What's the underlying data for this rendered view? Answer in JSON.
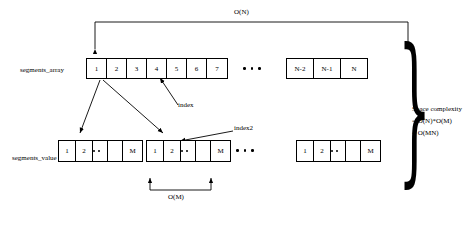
{
  "diagram": {
    "title_complexity_top": "O(N)",
    "labels": {
      "segments_array": "segments_array",
      "segments_value": "segments_value",
      "index": "index",
      "index2": "index2",
      "o_m": "O(M)",
      "space_complexity": "Space complexity",
      "space_eq1": "= O(N)*O(M)",
      "space_eq2": "= O(MN)"
    },
    "top_array": {
      "cells_left": [
        "1",
        "2",
        "3",
        "4",
        "5",
        "6",
        "7"
      ],
      "cells_right": [
        "N-2",
        "N-1",
        "N"
      ]
    },
    "value_arrays": [
      {
        "cells": [
          "1",
          "2",
          "",
          "",
          "M"
        ]
      },
      {
        "cells": [
          "1",
          "2",
          "",
          "",
          "M"
        ]
      },
      {
        "cells": [
          "1",
          "2",
          "",
          "",
          "M"
        ]
      }
    ]
  }
}
